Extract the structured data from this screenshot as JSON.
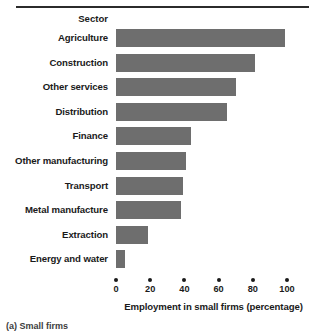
{
  "chart_data": {
    "type": "bar",
    "orientation": "horizontal",
    "title": "",
    "category_axis_title": "Sector",
    "xlabel": "Employment in small firms (percentage)",
    "ylabel": "Sector",
    "xlim": [
      0,
      100
    ],
    "xticks": [
      0,
      20,
      40,
      60,
      80,
      100
    ],
    "xtick_labels": [
      "0",
      "20",
      "40",
      "60",
      "80",
      "100"
    ],
    "grid": false,
    "legend": false,
    "bar_color": "#6e6e6e",
    "categories": [
      "Agriculture",
      "Construction",
      "Other services",
      "Distribution",
      "Finance",
      "Other manufacturing",
      "Transport",
      "Metal manufacture",
      "Extraction",
      "Energy and water"
    ],
    "values": [
      99,
      81,
      70,
      65,
      44,
      41,
      39,
      38,
      19,
      5
    ]
  },
  "caption": "(a) Small firms",
  "colors": {
    "bar": "#6e6e6e",
    "text": "#1a1a1a",
    "rule": "#2b2b2b",
    "background": "#ffffff"
  }
}
